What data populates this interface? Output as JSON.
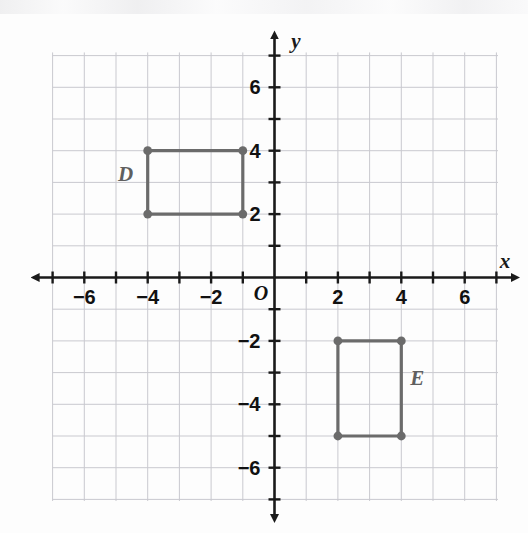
{
  "chart_data": {
    "type": "scatter",
    "title": "",
    "subtitle": "",
    "xlabel": "x",
    "ylabel": "y",
    "origin_label": "O",
    "xlim": [
      -7,
      7
    ],
    "ylim": [
      -7,
      7
    ],
    "grid": true,
    "grid_step": 1,
    "tick_step": 1,
    "label_step": 2,
    "legend": "none",
    "x_tick_labels": [
      "-6",
      "-4",
      "-2",
      "2",
      "4",
      "6"
    ],
    "x_tick_values": [
      -6,
      -4,
      -2,
      2,
      4,
      6
    ],
    "y_tick_labels": [
      "6",
      "4",
      "2",
      "-2",
      "-4",
      "-6"
    ],
    "y_tick_values": [
      6,
      4,
      2,
      -2,
      -4,
      -6
    ],
    "series": [
      {
        "name": "D",
        "label": "D",
        "label_x": -4.7,
        "label_y": 3.05,
        "shape": "rectangle",
        "closed": true,
        "points": [
          {
            "x": -4,
            "y": 4
          },
          {
            "x": -1,
            "y": 4
          },
          {
            "x": -1,
            "y": 2
          },
          {
            "x": -4,
            "y": 2
          }
        ]
      },
      {
        "name": "E",
        "label": "E",
        "label_x": 4.5,
        "label_y": -3.4,
        "shape": "rectangle",
        "closed": true,
        "points": [
          {
            "x": 2,
            "y": -2
          },
          {
            "x": 4,
            "y": -2
          },
          {
            "x": 4,
            "y": -5
          },
          {
            "x": 2,
            "y": -5
          }
        ]
      }
    ]
  },
  "colors": {
    "background": "#fdfdfd",
    "grid": "#c9c9cf",
    "axis": "#1a1a1a",
    "shape_stroke": "#6b6b6b",
    "shape_vertex": "#6b6b6b",
    "tick_label": "#111111",
    "shape_label": "#5f5f5f"
  }
}
